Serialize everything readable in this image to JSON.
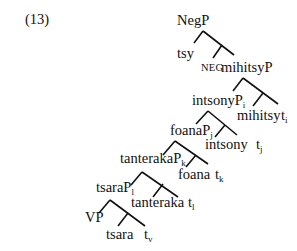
{
  "example_number": "(13)",
  "tree": {
    "root": "NegP",
    "nodes": [
      {
        "id": "negp",
        "text": "NegP",
        "sub": ""
      },
      {
        "id": "tsy",
        "text": "tsy",
        "sub": ""
      },
      {
        "id": "neg",
        "text": "NEG",
        "sub": ""
      },
      {
        "id": "mihitsyp",
        "text": "mihitsyP",
        "sub": ""
      },
      {
        "id": "intsonyp",
        "text": "intsonyP",
        "sub": "i"
      },
      {
        "id": "mihitsy",
        "text": "mihitsy",
        "sub": ""
      },
      {
        "id": "t_i",
        "text": "t",
        "sub": "i"
      },
      {
        "id": "foanap",
        "text": "foanaP",
        "sub": "j"
      },
      {
        "id": "intsony",
        "text": "intsony",
        "sub": ""
      },
      {
        "id": "t_j",
        "text": "t",
        "sub": "j"
      },
      {
        "id": "tanterakap",
        "text": "tanterakaP",
        "sub": "k"
      },
      {
        "id": "foana",
        "text": "foana",
        "sub": ""
      },
      {
        "id": "t_k",
        "text": "t",
        "sub": "k"
      },
      {
        "id": "tsarap",
        "text": "tsaraP",
        "sub": "l"
      },
      {
        "id": "tanteraka",
        "text": "tanteraka",
        "sub": ""
      },
      {
        "id": "t_l",
        "text": "t",
        "sub": "l"
      },
      {
        "id": "vp",
        "text": "VP",
        "sub": ""
      },
      {
        "id": "tsara",
        "text": "tsara",
        "sub": ""
      },
      {
        "id": "t_v",
        "text": "t",
        "sub": "v"
      }
    ]
  }
}
